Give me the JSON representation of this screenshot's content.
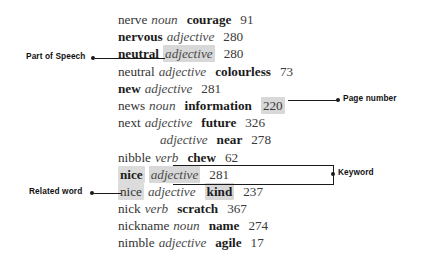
{
  "page": {
    "type": "dictionary-entry-diagram",
    "background_color": "#ffffff",
    "highlight_color": "#d8d8d8",
    "text_color": "#2b2b2b"
  },
  "entries": [
    {
      "headword": "nerve",
      "bold_headword": false,
      "pos": "noun",
      "synonym": "courage",
      "page": "91",
      "indent": false,
      "hl_pos": false,
      "hl_page": false,
      "hl_headword": false,
      "hl_syn": false
    },
    {
      "headword": "nervous",
      "bold_headword": true,
      "pos": "adjective",
      "synonym": "",
      "page": "280",
      "indent": false,
      "hl_pos": false,
      "hl_page": false,
      "hl_headword": false,
      "hl_syn": false
    },
    {
      "headword": "neutral",
      "bold_headword": true,
      "pos": "adjective",
      "synonym": "",
      "page": "280",
      "indent": false,
      "hl_pos": true,
      "hl_page": false,
      "hl_headword": false,
      "hl_syn": false
    },
    {
      "headword": "neutral",
      "bold_headword": false,
      "pos": "adjective",
      "synonym": "colourless",
      "page": "73",
      "indent": false,
      "hl_pos": false,
      "hl_page": false,
      "hl_headword": false,
      "hl_syn": false
    },
    {
      "headword": "new",
      "bold_headword": true,
      "pos": "adjective",
      "synonym": "",
      "page": "281",
      "indent": false,
      "hl_pos": false,
      "hl_page": false,
      "hl_headword": false,
      "hl_syn": false
    },
    {
      "headword": "news",
      "bold_headword": false,
      "pos": "noun",
      "synonym": "information",
      "page": "220",
      "indent": false,
      "hl_pos": false,
      "hl_page": true,
      "hl_headword": false,
      "hl_syn": false
    },
    {
      "headword": "next",
      "bold_headword": false,
      "pos": "adjective",
      "synonym": "future",
      "page": "326",
      "indent": false,
      "hl_pos": false,
      "hl_page": false,
      "hl_headword": false,
      "hl_syn": false
    },
    {
      "headword": "",
      "bold_headword": false,
      "pos": "adjective",
      "synonym": "near",
      "page": "278",
      "indent": true,
      "hl_pos": false,
      "hl_page": false,
      "hl_headword": false,
      "hl_syn": false
    },
    {
      "headword": "nibble",
      "bold_headword": false,
      "pos": "verb",
      "synonym": "chew",
      "page": "62",
      "indent": false,
      "hl_pos": false,
      "hl_page": false,
      "hl_headword": false,
      "hl_syn": false
    },
    {
      "headword": "nice",
      "bold_headword": true,
      "pos": "adjective",
      "synonym": "",
      "page": "281",
      "indent": false,
      "hl_pos": true,
      "hl_page": false,
      "hl_headword": true,
      "hl_syn": false
    },
    {
      "headword": "nice",
      "bold_headword": false,
      "pos": "adjective",
      "synonym": "kind",
      "page": "237",
      "indent": false,
      "hl_pos": false,
      "hl_page": false,
      "hl_headword": true,
      "hl_syn": true
    },
    {
      "headword": "nick",
      "bold_headword": false,
      "pos": "verb",
      "synonym": "scratch",
      "page": "367",
      "indent": false,
      "hl_pos": false,
      "hl_page": false,
      "hl_headword": false,
      "hl_syn": false
    },
    {
      "headword": "nickname",
      "bold_headword": false,
      "pos": "noun",
      "synonym": "name",
      "page": "274",
      "indent": false,
      "hl_pos": false,
      "hl_page": false,
      "hl_headword": false,
      "hl_syn": false
    },
    {
      "headword": "nimble",
      "bold_headword": false,
      "pos": "adjective",
      "synonym": "agile",
      "page": "17",
      "indent": false,
      "hl_pos": false,
      "hl_page": false,
      "hl_headword": false,
      "hl_syn": false
    }
  ],
  "callouts": {
    "part_of_speech": "Part of Speech",
    "related_word": "Related word",
    "page_number": "Page number",
    "keyword": "Keyword"
  }
}
